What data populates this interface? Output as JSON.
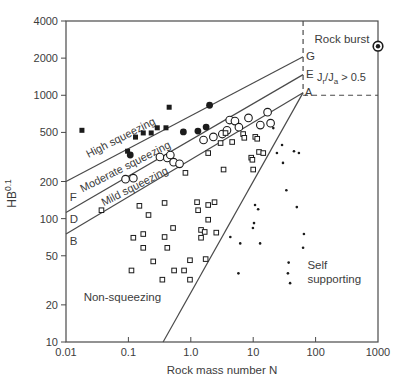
{
  "chart_data": {
    "type": "scatter",
    "scale": "log-log",
    "title": "",
    "xlabel": "Rock mass number N",
    "ylabel_base": "HB",
    "ylabel_sup": "0.1",
    "xlim": [
      0.01,
      1000
    ],
    "ylim": [
      10,
      4000
    ],
    "grid": "off",
    "ink_color": "#4a4a4a",
    "marker_color": "#1b1b1b",
    "text_color": "#3c3c3c",
    "x_ticks": [
      {
        "v": 0.01,
        "label": "0.01",
        "mark": false
      },
      {
        "v": 0.1,
        "label": "0.1",
        "mark": true
      },
      {
        "v": 1.0,
        "label": "1.0",
        "mark": true
      },
      {
        "v": 10,
        "label": "10",
        "mark": true
      },
      {
        "v": 100,
        "label": "100",
        "mark": true
      },
      {
        "v": 1000,
        "label": "1000",
        "mark": false
      }
    ],
    "y_ticks": [
      {
        "v": 10,
        "label": "10"
      },
      {
        "v": 20,
        "label": "20"
      },
      {
        "v": 50,
        "label": "50"
      },
      {
        "v": 100,
        "label": "100"
      },
      {
        "v": 200,
        "label": "200"
      },
      {
        "v": 500,
        "label": "500"
      },
      {
        "v": 1000,
        "label": "1000"
      },
      {
        "v": 2000,
        "label": "2000"
      },
      {
        "v": 4000,
        "label": "4000"
      }
    ],
    "boundary_lines": [
      {
        "name": "line-F-G",
        "style": "solid",
        "from": [
          0.01,
          200
        ],
        "to": [
          63,
          2050
        ]
      },
      {
        "name": "line-D-E",
        "style": "solid",
        "from": [
          0.01,
          112
        ],
        "to": [
          63,
          1470
        ]
      },
      {
        "name": "line-B-A",
        "style": "solid",
        "from": [
          0.01,
          75
        ],
        "to": [
          63,
          1050
        ]
      },
      {
        "name": "self-supporting-boundary",
        "style": "solid",
        "from": [
          0.36,
          10
        ],
        "to": [
          63,
          1050
        ]
      },
      {
        "name": "rock-burst-vertical-dashed",
        "style": "dashed",
        "from": [
          63,
          4000
        ],
        "to": [
          63,
          1050
        ]
      },
      {
        "name": "rock-burst-horizontal-dashed",
        "style": "dashed",
        "from": [
          63,
          1000
        ],
        "to": [
          1000,
          1000
        ]
      }
    ],
    "line_end_labels": [
      {
        "text": "F",
        "n": 0.0115,
        "hb": 150
      },
      {
        "text": "D",
        "n": 0.0115,
        "hb": 100
      },
      {
        "text": "B",
        "n": 0.0115,
        "hb": 66
      },
      {
        "text": "G",
        "n": 70,
        "hb": 2100
      },
      {
        "text": "E",
        "n": 70,
        "hb": 1480
      },
      {
        "text": "A",
        "n": 67,
        "hb": 1070
      }
    ],
    "region_labels": [
      {
        "name": "high-squeezing-label",
        "lines": [
          "High squeezing"
        ],
        "n": 0.08,
        "hb": 460,
        "rotation": -27,
        "anchor": "middle",
        "size": 11
      },
      {
        "name": "moderate-squeezing-label",
        "lines": [
          "Moderate squeezing"
        ],
        "n": 0.095,
        "hb": 268,
        "rotation": -27,
        "anchor": "middle",
        "size": 11
      },
      {
        "name": "mild-squeezing-label",
        "lines": [
          "Mild squeezing"
        ],
        "n": 0.134,
        "hb": 185,
        "rotation": -27,
        "anchor": "middle",
        "size": 11
      },
      {
        "name": "non-squeezing-label",
        "lines": [
          "Non-squeezing"
        ],
        "n": 0.08,
        "hb": 23,
        "rotation": 0,
        "anchor": "middle",
        "size": 11.5
      },
      {
        "name": "self-supporting-label",
        "lines": [
          "Self",
          "supporting"
        ],
        "n": 74,
        "hb": 42,
        "rotation": 0,
        "anchor": "start",
        "size": 11.5
      },
      {
        "name": "rock-burst-label",
        "lines": [
          "Rock burst"
        ],
        "n": 265,
        "hb": 2850,
        "rotation": 0,
        "anchor": "middle",
        "size": 11.5
      }
    ],
    "condition_label": {
      "name": "jr-ja-condition-label",
      "parts": [
        {
          "t": "J"
        },
        {
          "sub": "r"
        },
        {
          "t": "/J"
        },
        {
          "sub": "a"
        },
        {
          "t": " > 0.5"
        }
      ],
      "n": 105,
      "hb": 1400,
      "size": 11
    },
    "series": [
      {
        "name": "high-squeezing-cases",
        "marker": "filled-square",
        "points": [
          [
            0.018,
            520
          ],
          [
            0.097,
            352
          ],
          [
            0.13,
            458
          ],
          [
            0.173,
            495
          ],
          [
            0.232,
            495
          ],
          [
            0.29,
            545
          ],
          [
            0.4,
            545
          ],
          [
            0.45,
            800
          ]
        ]
      },
      {
        "name": "moderate-squeezing-cases",
        "marker": "filled-circle",
        "points": [
          [
            0.107,
            328
          ],
          [
            0.76,
            505
          ],
          [
            1.3,
            513
          ],
          [
            1.76,
            552
          ],
          [
            2.0,
            830
          ]
        ]
      },
      {
        "name": "mild-squeezing-cases",
        "marker": "open-circle",
        "points": [
          [
            0.09,
            209
          ],
          [
            0.12,
            213
          ],
          [
            0.32,
            316
          ],
          [
            0.42,
            310
          ],
          [
            0.47,
            328
          ],
          [
            0.53,
            287
          ],
          [
            0.66,
            278
          ],
          [
            1.6,
            434
          ],
          [
            2.3,
            460
          ],
          [
            3.2,
            485
          ],
          [
            3.8,
            520
          ],
          [
            4.2,
            630
          ],
          [
            5.1,
            618
          ],
          [
            5.9,
            551
          ],
          [
            8.4,
            655
          ],
          [
            13,
            573
          ],
          [
            17,
            730
          ],
          [
            19,
            594
          ]
        ]
      },
      {
        "name": "non-squeezing-cases",
        "marker": "open-square",
        "points": [
          [
            0.037,
            117
          ],
          [
            0.15,
            127
          ],
          [
            0.21,
            107
          ],
          [
            0.38,
            134
          ],
          [
            0.52,
            84
          ],
          [
            0.12,
            70
          ],
          [
            0.173,
            75
          ],
          [
            0.173,
            58
          ],
          [
            0.38,
            71
          ],
          [
            0.42,
            58
          ],
          [
            0.25,
            45
          ],
          [
            0.112,
            38
          ],
          [
            0.35,
            32
          ],
          [
            0.54,
            38
          ],
          [
            0.78,
            38
          ],
          [
            0.97,
            46
          ],
          [
            1.26,
            136
          ],
          [
            1.31,
            117
          ],
          [
            1.9,
            129
          ],
          [
            2.4,
            136
          ],
          [
            1.9,
            98
          ],
          [
            1.46,
            81
          ],
          [
            1.67,
            78
          ],
          [
            1.46,
            70
          ],
          [
            2.56,
            77
          ],
          [
            1.73,
            47
          ],
          [
            0.97,
            32
          ],
          [
            3.0,
            410
          ],
          [
            4.6,
            418
          ],
          [
            6.9,
            485
          ],
          [
            7.2,
            452
          ],
          [
            10.8,
            460
          ],
          [
            11.6,
            444
          ],
          [
            3.6,
            494
          ],
          [
            9.3,
            312
          ],
          [
            12.4,
            347
          ],
          [
            9.7,
            300
          ],
          [
            10,
            250
          ],
          [
            14.5,
            340
          ],
          [
            3.35,
            250
          ],
          [
            0.82,
            235
          ],
          [
            1.9,
            340
          ]
        ]
      },
      {
        "name": "self-supporting-cases",
        "marker": "dot",
        "points": [
          [
            29,
            395
          ],
          [
            24,
            340
          ],
          [
            45,
            352
          ],
          [
            54,
            340
          ],
          [
            30,
            283
          ],
          [
            34,
            170
          ],
          [
            50,
            124
          ],
          [
            10.7,
            129
          ],
          [
            12,
            119
          ],
          [
            10.3,
            92
          ],
          [
            9.9,
            84
          ],
          [
            4.3,
            71
          ],
          [
            6.2,
            63
          ],
          [
            12.9,
            63
          ],
          [
            65,
            75
          ],
          [
            63,
            58
          ],
          [
            37,
            44
          ],
          [
            36,
            36
          ],
          [
            5.8,
            36
          ],
          [
            39,
            30
          ],
          [
            21,
            542
          ]
        ]
      },
      {
        "name": "rock-burst-case",
        "marker": "bullseye",
        "points": [
          [
            1000,
            2500
          ]
        ]
      }
    ]
  }
}
